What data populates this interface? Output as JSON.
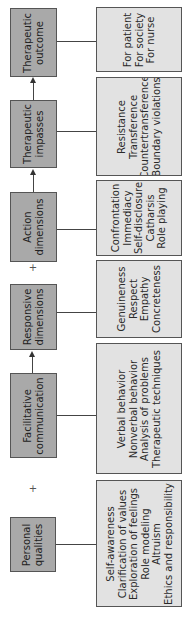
{
  "diagram": {
    "stages": [
      {
        "label_lines": [
          "Therapeutic",
          "outcome"
        ],
        "details": [
          "For patient",
          "For society",
          "For nurse"
        ]
      },
      {
        "label_lines": [
          "Therapeutic",
          "impasses"
        ],
        "details": [
          "Resistance",
          "Transference",
          "Countertransference",
          "Boundary violations"
        ]
      },
      {
        "label_lines": [
          "Action",
          "dimensions"
        ],
        "details": [
          "Confrontation",
          "Immediacy",
          "Self-disclosure",
          "Catharsis",
          "Role playing"
        ]
      },
      {
        "label_lines": [
          "Responsive",
          "dimensions"
        ],
        "details": [
          "Genuineness",
          "Respect",
          "Empathy",
          "Concreteness"
        ]
      },
      {
        "label_lines": [
          "Facilitative",
          "communication"
        ],
        "details": [
          "Verbal behavior",
          "Nonverbal behavior",
          "Analysis of problems",
          "Therapeutic techniques"
        ]
      },
      {
        "label_lines": [
          "Personal",
          "qualities"
        ],
        "details": [
          "Self-awareness",
          "Clarification of values",
          "Exploration of feelings",
          "Role modeling",
          "Altruism",
          "Ethics and responsibility"
        ]
      }
    ],
    "plus_symbols": [
      "+",
      "+"
    ],
    "colors": {
      "stage_box": "#a9a9a9",
      "detail_box": "#e2e2e2",
      "border": "#555555"
    }
  }
}
